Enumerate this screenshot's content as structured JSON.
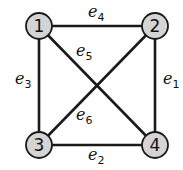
{
  "graph": {
    "nodes": [
      {
        "id": "1",
        "label": "1",
        "x": 39,
        "y": 26
      },
      {
        "id": "2",
        "label": "2",
        "x": 155,
        "y": 26
      },
      {
        "id": "3",
        "label": "3",
        "x": 39,
        "y": 145
      },
      {
        "id": "4",
        "label": "4",
        "x": 155,
        "y": 145
      }
    ],
    "edges": [
      {
        "id": "e1",
        "from": "2",
        "to": "4",
        "name": "e",
        "sub": "1"
      },
      {
        "id": "e2",
        "from": "3",
        "to": "4",
        "name": "e",
        "sub": "2"
      },
      {
        "id": "e3",
        "from": "1",
        "to": "3",
        "name": "e",
        "sub": "3"
      },
      {
        "id": "e4",
        "from": "1",
        "to": "2",
        "name": "e",
        "sub": "4"
      },
      {
        "id": "e5",
        "from": "1",
        "to": "4",
        "name": "e",
        "sub": "5"
      },
      {
        "id": "e6",
        "from": "2",
        "to": "3",
        "name": "e",
        "sub": "6"
      }
    ],
    "colors": {
      "node_fill": "#d4d4d4",
      "stroke": "#1a1a1a"
    }
  }
}
